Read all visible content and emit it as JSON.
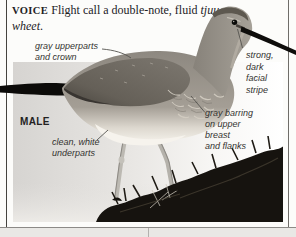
{
  "voice": {
    "heading": "VOICE",
    "body": " Flight call a double-note, fluid ",
    "call": "tjuu-wheet",
    "suffix": "."
  },
  "annotations": {
    "upperparts": "gray upperparts\nand crown",
    "facial_stripe": "strong,\ndark\nfacial\nstripe",
    "sex_label": "MALE",
    "underparts": "clean, white\nunderparts",
    "barring": "gray barring\non upper\nbreast\nand flanks"
  },
  "colors": {
    "page_bg": "#fcfcfa",
    "column_rule": "#55534f",
    "sky_left": "#d6d4d1",
    "sky_right": "#ffffff",
    "seaweed_dark": "#16130f",
    "bird_gray": "#8d8880",
    "belly_white": "#f6f3ed",
    "bill_black": "#0e0d0b",
    "label_text": "#33322f",
    "strip_bg": "#e9e8e5"
  }
}
